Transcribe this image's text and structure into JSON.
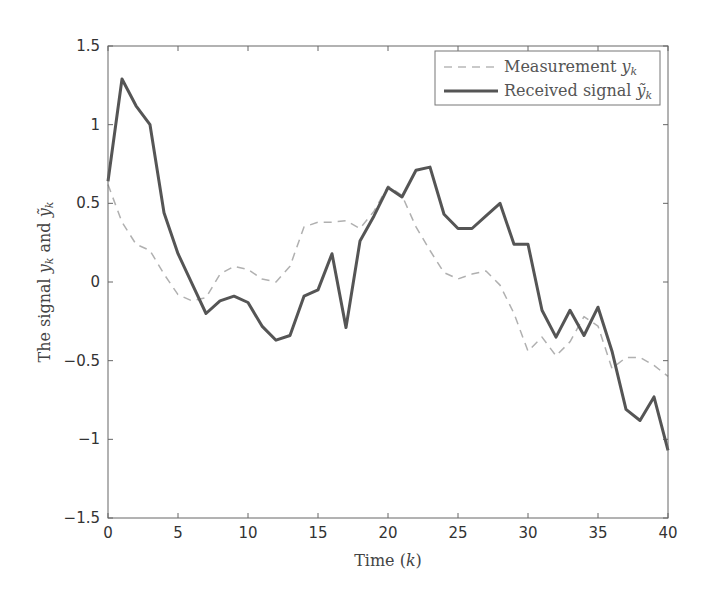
{
  "chart_data": {
    "type": "line",
    "title": "",
    "xlabel": "Time (k)",
    "ylabel": "The signal y_k and ỹ_k",
    "xlim": [
      0,
      40
    ],
    "ylim": [
      -1.5,
      1.5
    ],
    "xticks": [
      0,
      5,
      10,
      15,
      20,
      25,
      30,
      35,
      40
    ],
    "yticks": [
      -1.5,
      -1,
      -0.5,
      0,
      0.5,
      1,
      1.5
    ],
    "xtick_labels": [
      "0",
      "5",
      "10",
      "15",
      "20",
      "25",
      "30",
      "35",
      "40"
    ],
    "ytick_labels": [
      "−1.5",
      "−1",
      "−0.5",
      "0",
      "0.5",
      "1",
      "1.5"
    ],
    "grid": false,
    "legend_position": "upper right",
    "x": [
      0,
      1,
      2,
      3,
      4,
      5,
      6,
      7,
      8,
      9,
      10,
      11,
      12,
      13,
      14,
      15,
      16,
      17,
      18,
      19,
      20,
      21,
      22,
      23,
      24,
      25,
      26,
      27,
      28,
      29,
      30,
      31,
      32,
      33,
      34,
      35,
      36,
      37,
      38,
      39,
      40
    ],
    "series": [
      {
        "name": "Measurement y_k",
        "style": "dashed",
        "color": "#b0b0b0",
        "values": [
          0.62,
          0.38,
          0.24,
          0.2,
          0.05,
          -0.08,
          -0.12,
          -0.1,
          0.05,
          0.1,
          0.08,
          0.02,
          0.0,
          0.1,
          0.35,
          0.38,
          0.38,
          0.39,
          0.34,
          0.45,
          0.61,
          0.55,
          0.35,
          0.2,
          0.06,
          0.02,
          0.05,
          0.07,
          -0.02,
          -0.2,
          -0.44,
          -0.35,
          -0.47,
          -0.38,
          -0.22,
          -0.28,
          -0.55,
          -0.48,
          -0.48,
          -0.53,
          -0.6
        ]
      },
      {
        "name": "Received signal ỹ_k",
        "style": "solid",
        "color": "#555555",
        "values": [
          0.64,
          1.29,
          1.12,
          1.0,
          0.44,
          0.18,
          -0.01,
          -0.2,
          -0.12,
          -0.09,
          -0.13,
          -0.28,
          -0.37,
          -0.34,
          -0.09,
          -0.05,
          0.18,
          -0.29,
          0.26,
          0.42,
          0.6,
          0.54,
          0.71,
          0.73,
          0.43,
          0.34,
          0.34,
          0.42,
          0.5,
          0.24,
          0.24,
          -0.18,
          -0.35,
          -0.18,
          -0.34,
          -0.16,
          -0.44,
          -0.81,
          -0.88,
          -0.73,
          -1.07
        ]
      }
    ]
  },
  "legend": {
    "measurement_main": "Measurement ",
    "measurement_var": "y",
    "measurement_sub": "k",
    "received_main": "Received signal ",
    "received_var": "ỹ",
    "received_sub": "k"
  },
  "axes": {
    "xlabel_main": "Time (",
    "xlabel_var": "k",
    "xlabel_end": ")",
    "ylabel_main": "The signal ",
    "ylabel_var1": "y",
    "ylabel_sub1": "k",
    "ylabel_and": " and ",
    "ylabel_var2": "ỹ",
    "ylabel_sub2": "k"
  }
}
